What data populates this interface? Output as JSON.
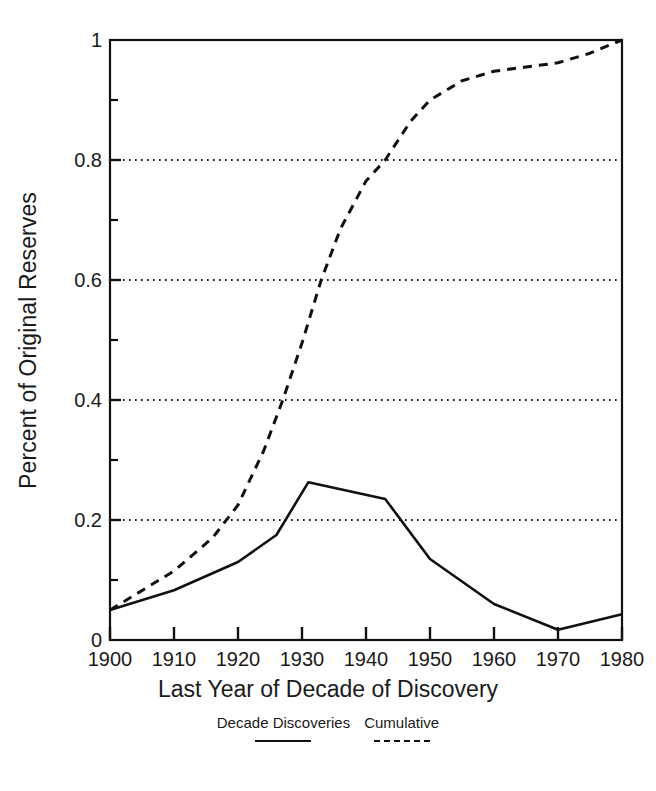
{
  "chart_data": {
    "type": "line",
    "title": "",
    "xlabel": "Last Year of Decade of Discovery",
    "ylabel": "Percent of Original Reserves",
    "xlim": [
      1900,
      1980
    ],
    "ylim": [
      0,
      1
    ],
    "grid": "horizontal-dotted",
    "legend_position": "below-axes",
    "x_ticks": [
      1900,
      1910,
      1920,
      1930,
      1940,
      1950,
      1960,
      1970,
      1980
    ],
    "x_tick_labels": [
      "1900",
      "1910",
      "1920",
      "1930",
      "1940",
      "1950",
      "1960",
      "1970",
      "1980"
    ],
    "y_ticks": [
      0,
      0.2,
      0.4,
      0.6,
      0.8,
      1
    ],
    "y_tick_labels": [
      "0",
      "0.2",
      "0.4",
      "0.6",
      "0.8",
      "1"
    ],
    "y_minor_ticks": [
      0.1,
      0.3,
      0.5,
      0.7,
      0.9
    ],
    "gridlines": [
      0.2,
      0.4,
      0.6,
      0.8
    ],
    "series": [
      {
        "name": "Decade Discoveries",
        "style": "solid",
        "color": "#111111",
        "x": [
          1900,
          1910,
          1920,
          1926,
          1931,
          1943,
          1950,
          1960,
          1970,
          1980
        ],
        "values": [
          0.05,
          0.083,
          0.13,
          0.175,
          0.263,
          0.235,
          0.135,
          0.06,
          0.017,
          0.043
        ]
      },
      {
        "name": "Cumulative",
        "style": "dashed",
        "color": "#111111",
        "x": [
          1900,
          1910,
          1916,
          1920,
          1924,
          1927,
          1930,
          1933,
          1936,
          1940,
          1943,
          1947,
          1950,
          1955,
          1960,
          1965,
          1970,
          1975,
          1980
        ],
        "values": [
          0.05,
          0.115,
          0.17,
          0.225,
          0.315,
          0.4,
          0.495,
          0.6,
          0.685,
          0.765,
          0.8,
          0.865,
          0.9,
          0.932,
          0.948,
          0.955,
          0.962,
          0.978,
          1.0
        ]
      }
    ]
  },
  "legend": {
    "entries": [
      {
        "label": "Decade Discoveries",
        "style": "solid"
      },
      {
        "label": "Cumulative",
        "style": "dashed"
      }
    ]
  },
  "axes": {
    "x_title": "Last Year of Decade of Discovery",
    "y_title": "Percent of Original Reserves"
  }
}
